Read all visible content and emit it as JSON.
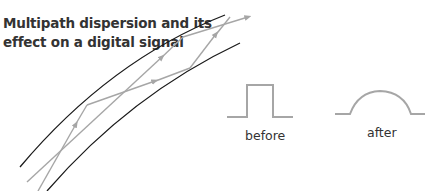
{
  "title_lines": [
    "Multipath dispersion and its",
    "effect on a digital signal"
  ],
  "labels": {
    "before": "before",
    "after": "after"
  },
  "colors": {
    "fiber_boundary": "#1a1a1a",
    "ray": "#a6a6a6",
    "signal": "#a6a6a6",
    "text": "#333333"
  },
  "rays": [
    {
      "name": "ray-zigzag",
      "bounces": 3
    },
    {
      "name": "ray-direct",
      "bounces": 1
    }
  ],
  "signals": [
    {
      "name": "before",
      "shape": "square-pulse"
    },
    {
      "name": "after",
      "shape": "rounded-pulse"
    }
  ]
}
